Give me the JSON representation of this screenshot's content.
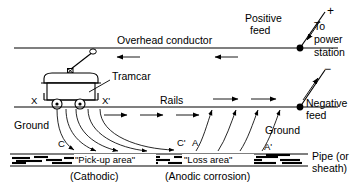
{
  "figure": {
    "type": "technical-diagram",
    "width": 353,
    "height": 184,
    "background_color": "#ffffff",
    "line_color": "#000000"
  },
  "labels": {
    "overhead_conductor": "Overhead conductor",
    "tramcar": "Tramcar",
    "rails": "Rails",
    "positive_feed": "Positive feed",
    "negative_feed": "Negative feed",
    "to_power_station": "To power station",
    "to_power_line1": "To",
    "to_power_line2": "power",
    "to_power_line3": "station",
    "positive_feed_line1": "Positive",
    "positive_feed_line2": "feed",
    "negative_feed_line1": "Negative",
    "negative_feed_line2": "feed",
    "plus_sign": "+",
    "minus_sign": "−",
    "ground_left": "Ground",
    "ground_right": "Ground",
    "pipe_line1": "Pipe (or",
    "pipe_line2": "sheath)",
    "pickup_area": "\"Pick-up area\"",
    "loss_area": "\"Loss area\"",
    "cathodic": "(Cathodic)",
    "anodic": "(Anodic corrosion)"
  },
  "point_labels": {
    "x": "X",
    "x_prime": "X'",
    "c": "C",
    "c_prime": "C'",
    "a": "A",
    "a_prime": "A'"
  },
  "icons": {
    "positive_terminal": "plus-icon",
    "negative_terminal": "minus-icon",
    "current_arrow": "arrow-icon",
    "feed_node": "node-dot-icon",
    "trolley_wheel": "trolley-contact-icon"
  },
  "geometry": {
    "overhead_conductor_y": 48,
    "rails_y": 107,
    "pipe_top_y": 154,
    "pipe_bottom_y": 166,
    "positive_feed_node": {
      "x": 300,
      "y": 48
    },
    "negative_feed_node": {
      "x": 300,
      "y": 107
    },
    "tramcar_x": 45,
    "tramcar_y": 70
  },
  "current_directions": {
    "overhead_conductor": "leftward (toward tramcar)",
    "rails": "rightward (toward negative feed)",
    "ground_pickup": "from rails down into pipe at C to C'",
    "ground_loss": "from pipe up to rails at A to A'"
  }
}
